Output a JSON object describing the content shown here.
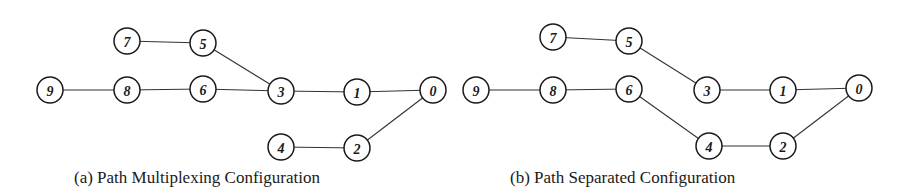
{
  "panels": [
    {
      "id": "a",
      "caption": "(a) Path Multiplexing Configuration",
      "caption_x": 74,
      "node_radius": 13,
      "nodes": [
        {
          "label": "9",
          "x": 50,
          "y": 90
        },
        {
          "label": "8",
          "x": 127,
          "y": 90
        },
        {
          "label": "6",
          "x": 203,
          "y": 89
        },
        {
          "label": "7",
          "x": 127,
          "y": 41
        },
        {
          "label": "5",
          "x": 203,
          "y": 43
        },
        {
          "label": "3",
          "x": 281,
          "y": 91
        },
        {
          "label": "1",
          "x": 357,
          "y": 92
        },
        {
          "label": "0",
          "x": 433,
          "y": 90
        },
        {
          "label": "4",
          "x": 281,
          "y": 147
        },
        {
          "label": "2",
          "x": 357,
          "y": 148
        }
      ],
      "edges": [
        [
          "9",
          "8"
        ],
        [
          "8",
          "6"
        ],
        [
          "6",
          "3"
        ],
        [
          "7",
          "5"
        ],
        [
          "5",
          "3"
        ],
        [
          "3",
          "1"
        ],
        [
          "1",
          "0"
        ],
        [
          "4",
          "2"
        ],
        [
          "2",
          "0"
        ]
      ]
    },
    {
      "id": "b",
      "caption": "(b) Path Separated Configuration",
      "caption_x": 510,
      "node_radius": 13,
      "nodes": [
        {
          "label": "9",
          "x": 476,
          "y": 90
        },
        {
          "label": "8",
          "x": 553,
          "y": 90
        },
        {
          "label": "6",
          "x": 629,
          "y": 89
        },
        {
          "label": "7",
          "x": 553,
          "y": 37
        },
        {
          "label": "5",
          "x": 629,
          "y": 41
        },
        {
          "label": "3",
          "x": 707,
          "y": 90
        },
        {
          "label": "1",
          "x": 783,
          "y": 90
        },
        {
          "label": "0",
          "x": 859,
          "y": 88
        },
        {
          "label": "4",
          "x": 709,
          "y": 146
        },
        {
          "label": "2",
          "x": 783,
          "y": 146
        }
      ],
      "edges": [
        [
          "9",
          "8"
        ],
        [
          "8",
          "6"
        ],
        [
          "6",
          "4"
        ],
        [
          "7",
          "5"
        ],
        [
          "5",
          "3"
        ],
        [
          "3",
          "1"
        ],
        [
          "1",
          "0"
        ],
        [
          "4",
          "2"
        ],
        [
          "2",
          "0"
        ]
      ]
    }
  ]
}
